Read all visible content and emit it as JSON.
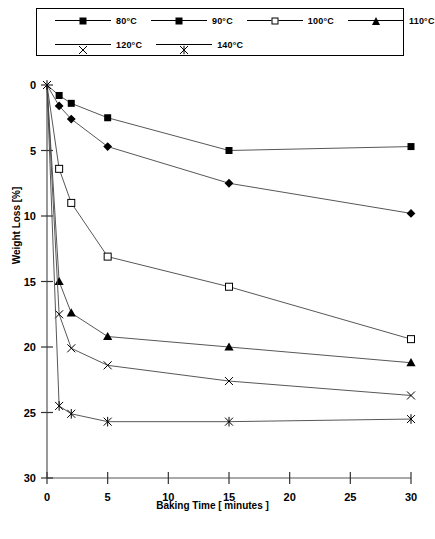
{
  "legend": {
    "entries": [
      {
        "label": "80°C",
        "marker": "filled-square"
      },
      {
        "label": "90°C",
        "marker": "filled-diamond"
      },
      {
        "label": "100°C",
        "marker": "open-square"
      },
      {
        "label": "110°C",
        "marker": "filled-triangle"
      },
      {
        "label": "120°C",
        "marker": "cross-x"
      },
      {
        "label": "140°C",
        "marker": "asterisk-star"
      }
    ]
  },
  "axes": {
    "x_ticks": [
      "0",
      "5",
      "10",
      "15",
      "20",
      "25",
      "30"
    ],
    "y_ticks": [
      "0",
      "5",
      "10",
      "15",
      "20",
      "25",
      "30"
    ],
    "x_title": "Baking Time [ minutes ]",
    "y_title": "Weight Loss [%]"
  },
  "chart_data": {
    "type": "line",
    "title": "",
    "xlabel": "Baking Time [ minutes ]",
    "ylabel": "Weight Loss [%]",
    "xlim": [
      0,
      30
    ],
    "ylim": [
      0,
      30
    ],
    "y_inverted": true,
    "grid": false,
    "legend_position": "top",
    "x": [
      0,
      1,
      2,
      5,
      15,
      30
    ],
    "series": [
      {
        "name": "80°C",
        "marker": "filled-square",
        "values": [
          0.0,
          0.8,
          1.4,
          2.5,
          5.0,
          4.7
        ]
      },
      {
        "name": "90°C",
        "marker": "filled-diamond",
        "values": [
          0.0,
          1.6,
          2.6,
          4.7,
          7.5,
          9.8
        ]
      },
      {
        "name": "100°C",
        "marker": "open-square",
        "values": [
          0.0,
          6.4,
          9.0,
          13.1,
          15.4,
          19.4
        ]
      },
      {
        "name": "110°C",
        "marker": "filled-triangle",
        "values": [
          0.0,
          15.0,
          17.4,
          19.2,
          20.0,
          21.2
        ]
      },
      {
        "name": "120°C",
        "marker": "cross-x",
        "values": [
          0.0,
          17.5,
          20.1,
          21.4,
          22.6,
          23.7
        ]
      },
      {
        "name": "140°C",
        "marker": "asterisk-star",
        "values": [
          0.0,
          24.5,
          25.1,
          25.7,
          25.7,
          25.5
        ]
      }
    ]
  }
}
